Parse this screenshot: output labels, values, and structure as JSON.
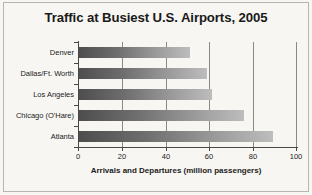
{
  "chart_data": {
    "type": "bar",
    "orientation": "horizontal",
    "title": "Traffic at Busiest U.S. Airports, 2005",
    "categories": [
      "Denver",
      "Dallas/Ft. Worth",
      "Los Angeles",
      "Chicago (O'Hare)",
      "Atlanta"
    ],
    "values": [
      51,
      59,
      61,
      76,
      89
    ],
    "xlabel": "Arrivals and Departures (million passengers)",
    "ylabel": "",
    "xlim": [
      0,
      100
    ],
    "xticks": [
      "0",
      "20",
      "40",
      "60",
      "80",
      "100"
    ],
    "xtick_values": [
      0,
      20,
      40,
      60,
      80,
      100
    ],
    "grid": "vertical",
    "legend": "none",
    "bar_color_start": "#4d4d4d",
    "bar_color_end": "#bdbdbd",
    "background_color": "#f7f6f2"
  }
}
